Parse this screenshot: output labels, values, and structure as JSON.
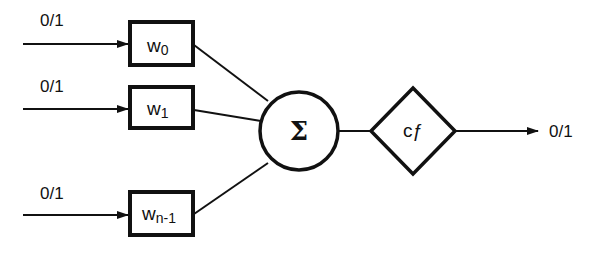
{
  "diagram": {
    "inputs": [
      {
        "label": "0/1",
        "weight": "w",
        "weight_sub": "0"
      },
      {
        "label": "0/1",
        "weight": "w",
        "weight_sub": "1"
      },
      {
        "label": "0/1",
        "weight": "w",
        "weight_sub": "n-1"
      }
    ],
    "summation": {
      "symbol": "Σ"
    },
    "activation": {
      "label": "cƒ"
    },
    "output": {
      "label": "0/1"
    },
    "colors": {
      "stroke": "#111111",
      "background": "#ffffff"
    }
  }
}
